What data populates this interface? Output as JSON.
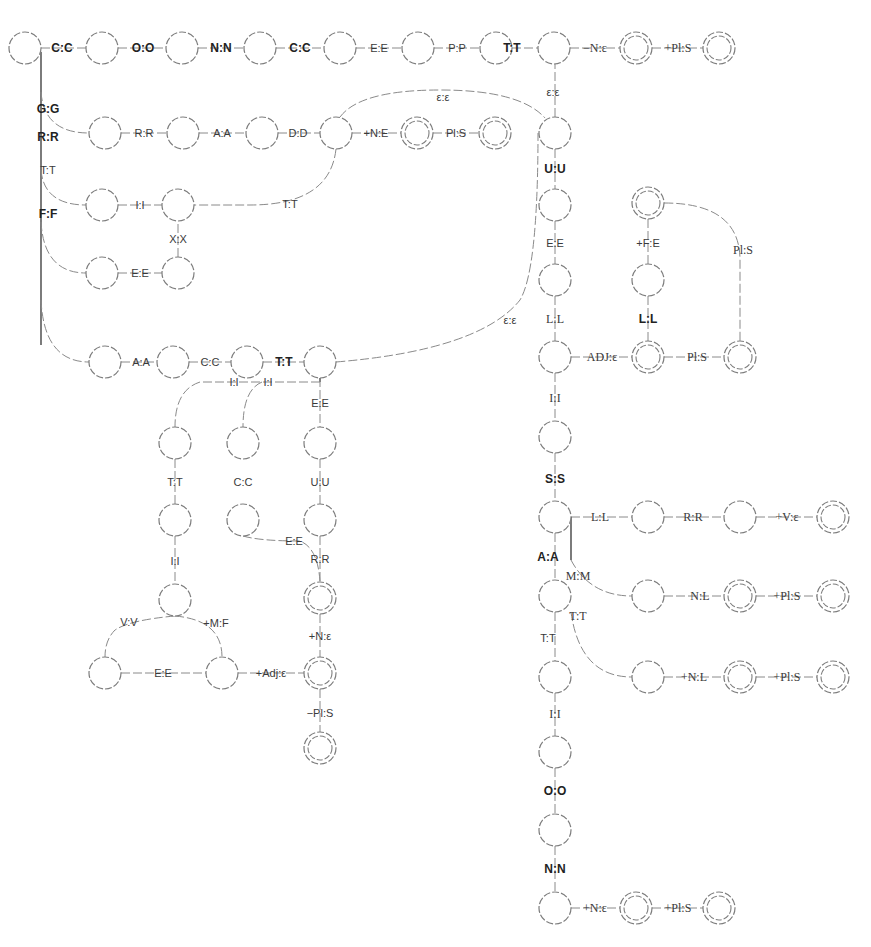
{
  "diagram": {
    "title": "",
    "type": "finite-state transducer",
    "colors": {
      "node_stroke": "#7d7d7d",
      "edge": "#8a8a8a",
      "label": "#3a3a3a",
      "background": "#ffffff"
    },
    "nodes": [
      {
        "id": "n0",
        "x": 25,
        "y": 48,
        "final": false
      },
      {
        "id": "n1",
        "x": 102,
        "y": 48,
        "final": false
      },
      {
        "id": "n2",
        "x": 182,
        "y": 48,
        "final": false
      },
      {
        "id": "n3",
        "x": 260,
        "y": 48,
        "final": false
      },
      {
        "id": "n4",
        "x": 340,
        "y": 48,
        "final": false
      },
      {
        "id": "n5",
        "x": 418,
        "y": 48,
        "final": false
      },
      {
        "id": "n6",
        "x": 496,
        "y": 48,
        "final": false
      },
      {
        "id": "n7",
        "x": 554,
        "y": 48,
        "final": false
      },
      {
        "id": "n8",
        "x": 636,
        "y": 48,
        "final": true
      },
      {
        "id": "n9",
        "x": 719,
        "y": 48,
        "final": true
      },
      {
        "id": "g1",
        "x": 105,
        "y": 133,
        "final": false
      },
      {
        "id": "g2",
        "x": 183,
        "y": 133,
        "final": false
      },
      {
        "id": "g3",
        "x": 262,
        "y": 133,
        "final": false
      },
      {
        "id": "g4",
        "x": 336,
        "y": 133,
        "final": false
      },
      {
        "id": "g5",
        "x": 417,
        "y": 133,
        "final": true
      },
      {
        "id": "g6",
        "x": 495,
        "y": 133,
        "final": true
      },
      {
        "id": "f1",
        "x": 102,
        "y": 205,
        "final": false
      },
      {
        "id": "f2",
        "x": 178,
        "y": 205,
        "final": false
      },
      {
        "id": "f3",
        "x": 102,
        "y": 273,
        "final": false
      },
      {
        "id": "f4",
        "x": 178,
        "y": 273,
        "final": false
      },
      {
        "id": "a1",
        "x": 105,
        "y": 362,
        "final": false
      },
      {
        "id": "a2",
        "x": 173,
        "y": 362,
        "final": false
      },
      {
        "id": "a3",
        "x": 247,
        "y": 362,
        "final": false
      },
      {
        "id": "a4",
        "x": 320,
        "y": 362,
        "final": false
      },
      {
        "id": "b1",
        "x": 175,
        "y": 443,
        "final": false
      },
      {
        "id": "b2",
        "x": 243,
        "y": 443,
        "final": false
      },
      {
        "id": "b3",
        "x": 320,
        "y": 443,
        "final": false
      },
      {
        "id": "b4",
        "x": 175,
        "y": 520,
        "final": false
      },
      {
        "id": "b5",
        "x": 243,
        "y": 520,
        "final": false
      },
      {
        "id": "b6",
        "x": 320,
        "y": 520,
        "final": false
      },
      {
        "id": "b7",
        "x": 175,
        "y": 600,
        "final": false
      },
      {
        "id": "b8",
        "x": 320,
        "y": 598,
        "final": true
      },
      {
        "id": "b9",
        "x": 105,
        "y": 673,
        "final": false
      },
      {
        "id": "b10",
        "x": 222,
        "y": 673,
        "final": false
      },
      {
        "id": "b11",
        "x": 320,
        "y": 673,
        "final": true
      },
      {
        "id": "b12",
        "x": 320,
        "y": 748,
        "final": true
      },
      {
        "id": "c1",
        "x": 555,
        "y": 133,
        "final": false
      },
      {
        "id": "c2",
        "x": 555,
        "y": 205,
        "final": false
      },
      {
        "id": "c3",
        "x": 555,
        "y": 280,
        "final": false
      },
      {
        "id": "c4",
        "x": 555,
        "y": 357,
        "final": false
      },
      {
        "id": "c5",
        "x": 555,
        "y": 437,
        "final": false
      },
      {
        "id": "c6",
        "x": 555,
        "y": 517,
        "final": false
      },
      {
        "id": "c7",
        "x": 555,
        "y": 596,
        "final": false
      },
      {
        "id": "c8",
        "x": 555,
        "y": 677,
        "final": false
      },
      {
        "id": "c9",
        "x": 555,
        "y": 752,
        "final": false
      },
      {
        "id": "c10",
        "x": 555,
        "y": 830,
        "final": false
      },
      {
        "id": "c11",
        "x": 555,
        "y": 908,
        "final": false
      },
      {
        "id": "c12",
        "x": 636,
        "y": 908,
        "final": true
      },
      {
        "id": "c13",
        "x": 719,
        "y": 908,
        "final": true
      },
      {
        "id": "d1",
        "x": 648,
        "y": 203,
        "final": true
      },
      {
        "id": "d2",
        "x": 648,
        "y": 280,
        "final": false
      },
      {
        "id": "d3",
        "x": 648,
        "y": 357,
        "final": true
      },
      {
        "id": "d4",
        "x": 740,
        "y": 357,
        "final": true
      },
      {
        "id": "e1",
        "x": 648,
        "y": 517,
        "final": false
      },
      {
        "id": "e2",
        "x": 740,
        "y": 517,
        "final": false
      },
      {
        "id": "e3",
        "x": 833,
        "y": 517,
        "final": true
      },
      {
        "id": "e4",
        "x": 648,
        "y": 596,
        "final": false
      },
      {
        "id": "e5",
        "x": 740,
        "y": 596,
        "final": true
      },
      {
        "id": "e6",
        "x": 833,
        "y": 596,
        "final": true
      },
      {
        "id": "e7",
        "x": 648,
        "y": 677,
        "final": false
      },
      {
        "id": "e8",
        "x": 740,
        "y": 677,
        "final": true
      },
      {
        "id": "e9",
        "x": 833,
        "y": 677,
        "final": true
      }
    ],
    "labels": {
      "top": [
        "C:C",
        "O:O",
        "N:N",
        "C:C",
        "E:E",
        "P:P",
        "T:T",
        "−N:ε",
        "+Pl:S"
      ],
      "left_spine": [
        "G:G",
        "R:R",
        "T:T",
        "F:F"
      ],
      "grad": [
        "R:R",
        "A:A",
        "D:D",
        "+N:E",
        "Pl:S"
      ],
      "exit_tt": "T:T",
      "fix": [
        "I:I",
        "X:X",
        "E:E"
      ],
      "fact": [
        "A:A",
        "C:C",
        "T:T"
      ],
      "fact_branch": [
        "I:I",
        "I:I",
        "E:E",
        "T:T",
        "C:C",
        "U:U",
        "I:I",
        "E:E",
        "R:R",
        "V:V",
        "+M:F",
        "E:E",
        "+Adj:ε",
        "+N:ε",
        "−Pl:S"
      ],
      "eps_top": "ε:ε",
      "eps_mid": "ε:ε",
      "eps_right": "ε:ε",
      "column": [
        "U:U",
        "E:E",
        "L:L",
        "I:I",
        "S:S",
        "A:A",
        "T:T",
        "I:I",
        "O:O",
        "N:N"
      ],
      "col_end": [
        "+N:ε",
        "+Pl:S"
      ],
      "adj": [
        "ADJ:ε",
        "L:L",
        "+F:E",
        "Pl:S",
        "Pl:S"
      ],
      "s_branch": [
        "L:L",
        "R:R",
        "+V:ε"
      ],
      "m_branch": [
        "M:M",
        "N:L",
        "+Pl:S"
      ],
      "t_branch": [
        "T:T",
        "+N:L",
        "+Pl:S"
      ]
    }
  }
}
